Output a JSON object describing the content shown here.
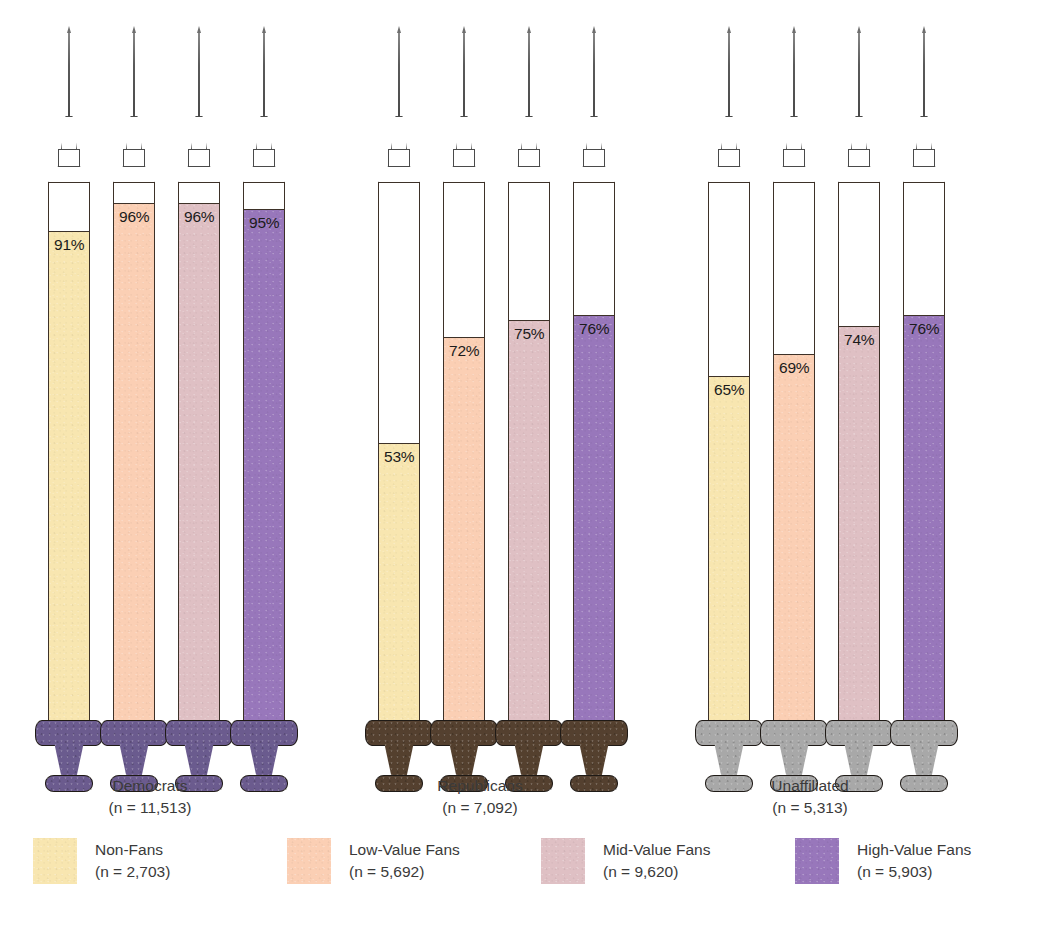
{
  "chart_data": {
    "type": "bar",
    "title": "",
    "xlabel": "",
    "ylabel": "",
    "ylim": [
      0,
      100
    ],
    "unit": "%",
    "grid": false,
    "legend_position": "bottom",
    "marker_style": "syringe-barrel-fill",
    "categories": [
      "Democrats",
      "Republicans",
      "Unaffiliated"
    ],
    "category_sample_sizes": [
      "(n = 11,513)",
      "(n = 7,092)",
      "(n = 5,313)"
    ],
    "series": [
      {
        "name": "Non-Fans",
        "sample_size": "(n = 2,703)",
        "color": "#f8e6b0",
        "values": [
          91,
          53,
          65
        ]
      },
      {
        "name": "Low-Value Fans",
        "sample_size": "(n = 5,692)",
        "color": "#fbcfb4",
        "values": [
          96,
          72,
          69
        ]
      },
      {
        "name": "Mid-Value Fans",
        "sample_size": "(n = 9,620)",
        "color": "#dfc0c4",
        "values": [
          96,
          75,
          74
        ]
      },
      {
        "name": "High-Value Fans",
        "sample_size": "(n = 5,903)",
        "color": "#9877bb",
        "values": [
          95,
          76,
          76
        ]
      }
    ],
    "group_base_colors": [
      "#6b5b8e",
      "#54402f",
      "#a8a8a8"
    ]
  },
  "groups": [
    {
      "name": "Democrats",
      "n": "(n = 11,513)",
      "base_color": "#6b5b8e",
      "bars": [
        {
          "label": "91%",
          "value": 91,
          "color": "#f8e6b0",
          "series": "Non-Fans"
        },
        {
          "label": "96%",
          "value": 96,
          "color": "#fbcfb4",
          "series": "Low-Value Fans"
        },
        {
          "label": "96%",
          "value": 96,
          "color": "#dfc0c4",
          "series": "Mid-Value Fans"
        },
        {
          "label": "95%",
          "value": 95,
          "color": "#9877bb",
          "series": "High-Value Fans"
        }
      ]
    },
    {
      "name": "Republicans",
      "n": "(n = 7,092)",
      "base_color": "#54402f",
      "bars": [
        {
          "label": "53%",
          "value": 53,
          "color": "#f8e6b0",
          "series": "Non-Fans"
        },
        {
          "label": "72%",
          "value": 72,
          "color": "#fbcfb4",
          "series": "Low-Value Fans"
        },
        {
          "label": "75%",
          "value": 75,
          "color": "#dfc0c4",
          "series": "Mid-Value Fans"
        },
        {
          "label": "76%",
          "value": 76,
          "color": "#9877bb",
          "series": "High-Value Fans"
        }
      ]
    },
    {
      "name": "Unaffiliated",
      "n": "(n = 5,313)",
      "base_color": "#a8a8a8",
      "bars": [
        {
          "label": "65%",
          "value": 65,
          "color": "#f8e6b0",
          "series": "Non-Fans"
        },
        {
          "label": "69%",
          "value": 69,
          "color": "#fbcfb4",
          "series": "Low-Value Fans"
        },
        {
          "label": "74%",
          "value": 74,
          "color": "#dfc0c4",
          "series": "Mid-Value Fans"
        },
        {
          "label": "76%",
          "value": 76,
          "color": "#9877bb",
          "series": "High-Value Fans"
        }
      ]
    }
  ],
  "legend": [
    {
      "label": "Non-Fans",
      "n": "(n = 2,703)",
      "color": "#f8e6b0"
    },
    {
      "label": "Low-Value Fans",
      "n": "(n = 5,692)",
      "color": "#fbcfb4"
    },
    {
      "label": "Mid-Value Fans",
      "n": "(n = 9,620)",
      "color": "#dfc0c4"
    },
    {
      "label": "High-Value Fans",
      "n": "(n = 5,903)",
      "color": "#9877bb"
    }
  ]
}
